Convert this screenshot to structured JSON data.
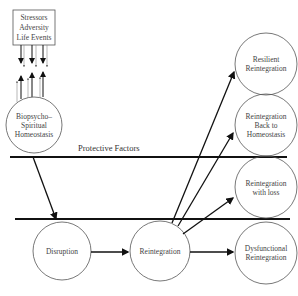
{
  "diagram": {
    "type": "resiliency-model",
    "stressors_box": {
      "lines": [
        "Stressors",
        "Adversity",
        "Life Events"
      ]
    },
    "nodes": {
      "homeostasis": {
        "lines": [
          "Biopsycho–",
          "Spiritual",
          "Homeostasis"
        ]
      },
      "disruption": {
        "label": "Disruption"
      },
      "reintegration": {
        "label": "Reintegration"
      },
      "resilient": {
        "lines": [
          "Resilient",
          "Reintegration"
        ]
      },
      "back_to_homeostasis": {
        "lines": [
          "Reintegration",
          "Back to",
          "Homeostasis"
        ]
      },
      "with_loss": {
        "lines": [
          "Reintegration",
          "with loss"
        ]
      },
      "dysfunctional": {
        "lines": [
          "Dysfunctional",
          "Reintegration"
        ]
      }
    },
    "protective_factors_label": "Protective Factors",
    "edges": [
      [
        "homeostasis",
        "disruption"
      ],
      [
        "disruption",
        "reintegration"
      ],
      [
        "reintegration",
        "resilient"
      ],
      [
        "reintegration",
        "back_to_homeostasis"
      ],
      [
        "reintegration",
        "with_loss"
      ],
      [
        "reintegration",
        "dysfunctional"
      ],
      [
        "stressors",
        "homeostasis"
      ]
    ],
    "colors": {
      "stroke": "#111111",
      "thin_stroke": "#555555",
      "text": "#444444"
    }
  }
}
